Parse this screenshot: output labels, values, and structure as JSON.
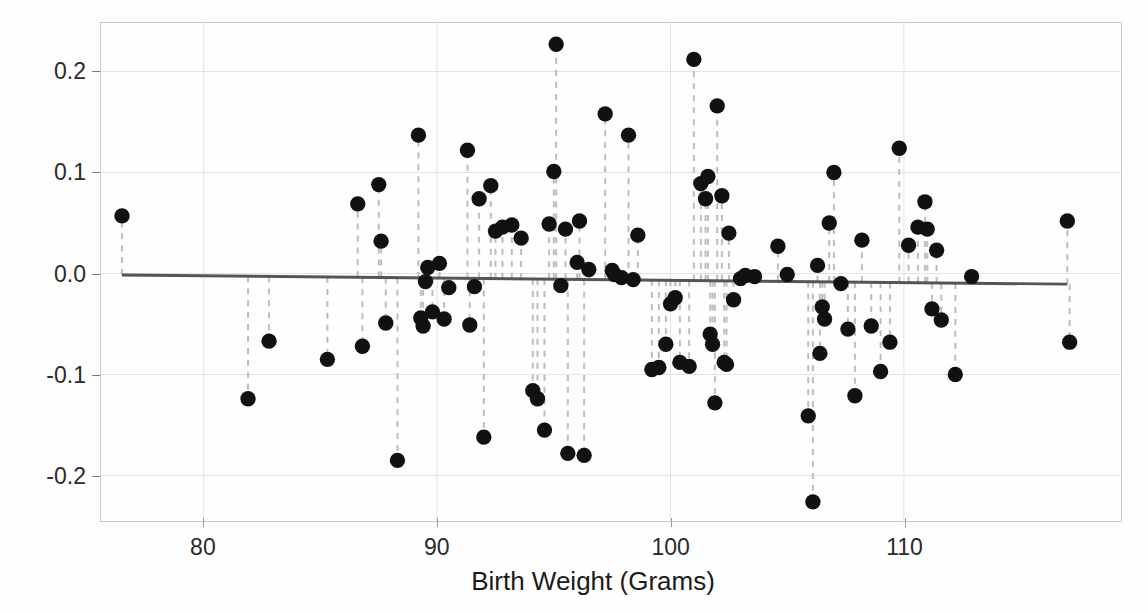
{
  "chart_data": {
    "type": "scatter",
    "title": "",
    "xlabel": "Birth Weight (Grams)",
    "ylabel": "Residuals",
    "xlim": [
      75.6,
      119.3
    ],
    "ylim": [
      -0.245,
      0.248
    ],
    "xticks": [
      80,
      90,
      100,
      110
    ],
    "xtick_labels": [
      "80",
      "90",
      "100",
      "110"
    ],
    "yticks": [
      0.2,
      0.1,
      0.0,
      -0.1,
      -0.2
    ],
    "ytick_labels": [
      "0.2",
      "0.1",
      "0.0",
      "-0.1",
      "-0.2"
    ],
    "grid": true,
    "grid_color": "#e3e3e3",
    "legend": "none",
    "marker": "filled-circle",
    "marker_color": "#111111",
    "marker_size": 9,
    "stems": true,
    "stem_style": "dashed",
    "stem_color": "#bdbdbd",
    "reference_line": {
      "name": "zero-residual-line",
      "color": "#555555",
      "width": 3,
      "x_start": 76.5,
      "y_start": -0.0015,
      "x_end": 117.0,
      "y_end": -0.0105
    },
    "x": [
      76.5,
      81.9,
      82.8,
      85.3,
      86.6,
      86.8,
      87.5,
      87.6,
      87.8,
      88.3,
      89.2,
      89.3,
      89.4,
      89.5,
      89.6,
      89.8,
      90.1,
      90.3,
      90.5,
      91.3,
      91.4,
      91.6,
      91.8,
      92.0,
      92.3,
      92.5,
      92.8,
      93.2,
      93.6,
      94.1,
      94.3,
      94.6,
      94.8,
      95.0,
      95.1,
      95.3,
      95.5,
      95.6,
      96.0,
      96.1,
      96.3,
      96.5,
      97.2,
      97.5,
      97.6,
      97.9,
      98.2,
      98.4,
      98.6,
      99.2,
      99.5,
      99.8,
      100.0,
      100.2,
      100.4,
      100.8,
      101.0,
      101.3,
      101.5,
      101.6,
      101.7,
      101.8,
      101.9,
      102.0,
      102.2,
      102.3,
      102.4,
      102.5,
      102.7,
      103.0,
      103.2,
      103.6,
      104.6,
      105.0,
      105.9,
      106.1,
      106.3,
      106.4,
      106.5,
      106.6,
      106.8,
      107.0,
      107.3,
      107.6,
      107.9,
      108.2,
      108.6,
      109.0,
      109.4,
      109.8,
      110.2,
      110.6,
      110.9,
      111.0,
      111.2,
      111.4,
      111.6,
      112.2,
      112.9,
      117.0,
      117.1
    ],
    "y": [
      0.057,
      -0.124,
      -0.067,
      -0.085,
      0.069,
      -0.072,
      0.088,
      0.032,
      -0.049,
      -0.185,
      0.137,
      -0.044,
      -0.052,
      -0.008,
      0.006,
      -0.038,
      0.01,
      -0.045,
      -0.014,
      0.122,
      -0.051,
      -0.013,
      0.074,
      -0.162,
      0.087,
      0.042,
      0.046,
      0.048,
      0.035,
      -0.116,
      -0.124,
      -0.155,
      0.049,
      0.101,
      0.227,
      -0.012,
      0.044,
      -0.178,
      0.011,
      0.052,
      -0.18,
      0.004,
      0.158,
      0.003,
      -0.001,
      -0.004,
      0.137,
      -0.006,
      0.038,
      -0.095,
      -0.093,
      -0.07,
      -0.03,
      -0.024,
      -0.088,
      -0.092,
      0.212,
      0.089,
      0.074,
      0.096,
      -0.06,
      -0.07,
      -0.128,
      0.166,
      0.077,
      -0.088,
      -0.09,
      0.04,
      -0.026,
      -0.005,
      -0.002,
      -0.003,
      0.027,
      -0.001,
      -0.141,
      -0.226,
      0.008,
      -0.079,
      -0.033,
      -0.045,
      0.05,
      0.1,
      -0.01,
      -0.055,
      -0.121,
      0.033,
      -0.052,
      -0.097,
      -0.068,
      0.124,
      0.028,
      0.046,
      0.071,
      0.044,
      -0.035,
      0.023,
      -0.046,
      -0.1,
      -0.003,
      0.052,
      -0.068
    ]
  }
}
